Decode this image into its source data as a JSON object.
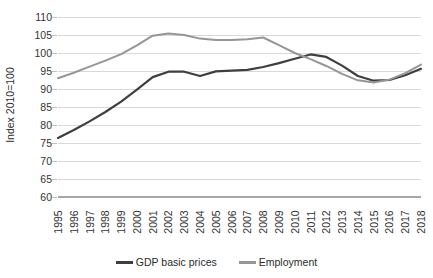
{
  "chart_data": {
    "type": "line",
    "title": "",
    "xlabel": "",
    "ylabel": "Index 2010=100",
    "ylim": [
      60,
      110
    ],
    "ytick_step": 5,
    "yticks": [
      60,
      65,
      70,
      75,
      80,
      85,
      90,
      95,
      100,
      105,
      110
    ],
    "grid": true,
    "legend_position": "bottom",
    "categories": [
      "1995",
      "1996",
      "1997",
      "1998",
      "1999",
      "2000",
      "2001",
      "2002",
      "2003",
      "2004",
      "2005",
      "2006",
      "2007",
      "2008",
      "2009",
      "2010",
      "2011",
      "2012",
      "2013",
      "2014",
      "2015",
      "2016",
      "2017",
      "2018"
    ],
    "series": [
      {
        "name": "GDP basic prices",
        "color": "#3f3f3f",
        "values": [
          76.4,
          78.6,
          81.0,
          83.6,
          86.5,
          89.8,
          93.3,
          94.8,
          94.8,
          93.6,
          94.9,
          95.1,
          95.3,
          96.1,
          97.2,
          98.4,
          99.6,
          98.9,
          96.5,
          93.6,
          92.3,
          92.5,
          93.8,
          95.6
        ],
        "values_note": "read from gridlines, index 2010=100"
      },
      {
        "name": "Employment",
        "color": "#969696",
        "values": [
          93.0,
          94.5,
          96.2,
          97.9,
          99.7,
          102.1,
          104.8,
          105.4,
          105.0,
          104.0,
          103.6,
          103.6,
          103.8,
          104.3,
          102.2,
          100.0,
          98.3,
          96.4,
          94.2,
          92.4,
          91.8,
          92.6,
          94.4,
          96.8
        ],
        "values_note": "read from gridlines, index 2010=100"
      }
    ]
  },
  "legend": {
    "items": [
      {
        "label": "GDP basic prices",
        "color": "#3f3f3f"
      },
      {
        "label": "Employment",
        "color": "#969696"
      }
    ]
  },
  "axis": {
    "y_title": "Index 2010=100"
  },
  "colors": {
    "background": "#ffffff",
    "gridline": "#d9d9d9",
    "axisline": "#a6a6a6",
    "tick_text": "#333333",
    "series_gdp": "#3f3f3f",
    "series_employment": "#969696"
  }
}
